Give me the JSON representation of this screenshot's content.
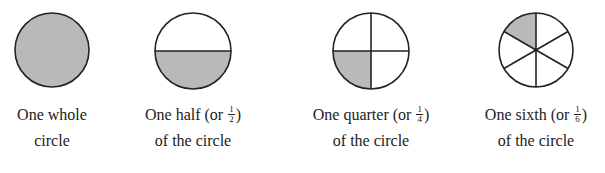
{
  "colors": {
    "fill": "#b9b9b9",
    "stroke": "#222222",
    "background": "#ffffff"
  },
  "figures": [
    {
      "id": "whole",
      "line1": "One whole",
      "line2": "circle",
      "fraction": null,
      "center": [
        52,
        50
      ],
      "radius": 37,
      "divisions": 1,
      "shaded_parts": 1
    },
    {
      "id": "half",
      "line1_prefix": "One half (or ",
      "fraction": {
        "num": "1",
        "den": "2"
      },
      "line1_suffix": ")",
      "line2": "of the circle",
      "center": [
        193,
        50
      ],
      "radius": 38,
      "divisions": 2,
      "shaded_parts": 1
    },
    {
      "id": "quarter",
      "line1_prefix": "One quarter (or ",
      "fraction": {
        "num": "1",
        "den": "4"
      },
      "line1_suffix": ")",
      "line2": "of the circle",
      "center": [
        371,
        51
      ],
      "radius": 38,
      "divisions": 4,
      "shaded_parts": 1
    },
    {
      "id": "sixth",
      "line1_prefix": "One sixth (or ",
      "fraction": {
        "num": "1",
        "den": "6"
      },
      "line1_suffix": ")",
      "line2": "of the circle",
      "center": [
        536,
        50
      ],
      "radius": 37,
      "divisions": 6,
      "shaded_parts": 1
    }
  ]
}
